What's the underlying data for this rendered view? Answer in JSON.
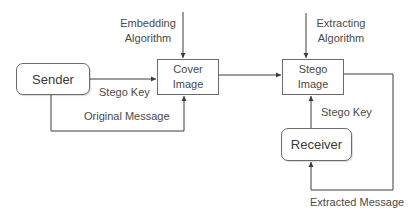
{
  "diagram": {
    "type": "steganography-flow",
    "nodes": {
      "sender": {
        "label": "Sender"
      },
      "cover_image": {
        "label_line1": "Cover",
        "label_line2": "Image"
      },
      "stego_image": {
        "label_line1": "Stego",
        "label_line2": "Image"
      },
      "receiver": {
        "label": "Receiver"
      }
    },
    "edge_labels": {
      "embedding_line1": "Embedding",
      "embedding_line2": "Algorithm",
      "extracting_line1": "Extracting",
      "extracting_line2": "Algorithm",
      "stego_key_sender": "Stego Key",
      "original_message": "Original Message",
      "stego_key_receiver": "Stego Key",
      "extracted_message": "Extracted Message"
    },
    "edges": [
      {
        "from": "sender",
        "to": "cover_image",
        "label": "Stego Key"
      },
      {
        "from": "sender",
        "to": "cover_image",
        "label": "Original Message"
      },
      {
        "from": "embedding_algorithm",
        "to": "cover_image"
      },
      {
        "from": "cover_image",
        "to": "stego_image"
      },
      {
        "from": "extracting_algorithm",
        "to": "stego_image"
      },
      {
        "from": "receiver",
        "to": "stego_image",
        "label": "Stego Key"
      },
      {
        "from": "stego_image",
        "to": "receiver",
        "label": "Extracted Message"
      }
    ],
    "colors": {
      "line": "#3c3c3c",
      "border": "#6b6b6b",
      "text": "#4a4a4a"
    }
  }
}
